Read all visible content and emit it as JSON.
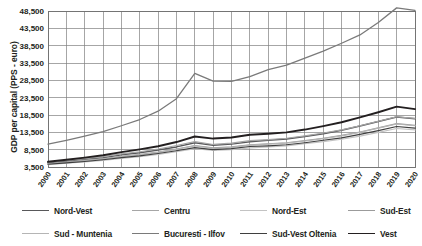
{
  "chart_data": {
    "type": "line",
    "title": "",
    "xlabel": "",
    "ylabel": "GDP per capital (PPS - euro)",
    "grid": true,
    "legend_position": "bottom",
    "ylim": [
      3500,
      48500
    ],
    "yticks": [
      "3,500",
      "8,500",
      "13,500",
      "18,500",
      "23,500",
      "28,500",
      "33,500",
      "38,500",
      "43,500",
      "48,500"
    ],
    "ytick_values": [
      3500,
      8500,
      13500,
      18500,
      23500,
      28500,
      33500,
      38500,
      43500,
      48500
    ],
    "categories": [
      "2000",
      "2001",
      "2002",
      "2003",
      "2004",
      "2005",
      "2006",
      "2007",
      "2008",
      "2009",
      "2010",
      "2011",
      "2012",
      "2013",
      "2014",
      "2015",
      "2016",
      "2017",
      "2018",
      "2019",
      "2020"
    ],
    "series": [
      {
        "name": "Nord-Vest",
        "color": "#58585a",
        "width": 1.5,
        "values": [
          4700,
          5200,
          5700,
          6200,
          7000,
          7600,
          8400,
          9300,
          10500,
          9800,
          10100,
          10800,
          11200,
          11600,
          12300,
          13100,
          14100,
          15300,
          16600,
          17900,
          17400
        ]
      },
      {
        "name": "Centru",
        "color": "#a6a6a6",
        "width": 1.2,
        "values": [
          4900,
          5400,
          5900,
          6500,
          7300,
          7900,
          8700,
          9700,
          10800,
          10000,
          10400,
          11100,
          11400,
          11800,
          12500,
          13300,
          14200,
          15400,
          16700,
          18000,
          17500
        ]
      },
      {
        "name": "Nord-Est",
        "color": "#c3c3c3",
        "width": 1.2,
        "values": [
          4200,
          4600,
          5000,
          5400,
          6000,
          6500,
          7100,
          7900,
          8800,
          8300,
          8500,
          9000,
          9300,
          9600,
          10200,
          10800,
          11500,
          12400,
          13500,
          14600,
          14200
        ]
      },
      {
        "name": "Sud-Est",
        "color": "#9b9b9b",
        "width": 1.2,
        "values": [
          4500,
          4900,
          5400,
          5900,
          6600,
          7100,
          7800,
          8700,
          9700,
          9000,
          9300,
          9900,
          10200,
          10500,
          11100,
          11800,
          12600,
          13600,
          14800,
          16000,
          15500
        ]
      },
      {
        "name": "Sud - Muntenia",
        "color": "#b5b5b5",
        "width": 1.2,
        "values": [
          4400,
          4800,
          5300,
          5800,
          6500,
          7000,
          7700,
          8600,
          9600,
          8900,
          9200,
          9800,
          10100,
          10400,
          11000,
          11700,
          12500,
          13500,
          14700,
          15900,
          15400
        ]
      },
      {
        "name": "Bucuresti - Ilfov",
        "color": "#7a7a7a",
        "width": 1.3,
        "values": [
          10100,
          11200,
          12400,
          13700,
          15400,
          17200,
          19600,
          23200,
          30500,
          28300,
          28200,
          29600,
          31600,
          32900,
          34900,
          36900,
          39200,
          41600,
          45200,
          49400,
          48700
        ]
      },
      {
        "name": "Sud-Vest Oltenia",
        "color": "#3f3f3f",
        "width": 1.1,
        "values": [
          4300,
          4700,
          5100,
          5600,
          6200,
          6700,
          7400,
          8200,
          9100,
          8500,
          8800,
          9400,
          9600,
          9900,
          10500,
          11200,
          11900,
          12900,
          14000,
          15200,
          14700
        ]
      },
      {
        "name": "Vest",
        "color": "#231f20",
        "width": 1.9,
        "values": [
          5000,
          5600,
          6200,
          6900,
          7800,
          8600,
          9500,
          10700,
          12300,
          11700,
          12000,
          12800,
          13100,
          13500,
          14300,
          15300,
          16400,
          17800,
          19300,
          20900,
          20200
        ]
      }
    ]
  },
  "legend": {
    "items": [
      {
        "label": "Nord-Vest"
      },
      {
        "label": "Centru"
      },
      {
        "label": "Nord-Est"
      },
      {
        "label": "Sud-Est"
      },
      {
        "label": "Sud - Muntenia"
      },
      {
        "label": "Bucuresti - Ilfov"
      },
      {
        "label": "Sud-Vest Oltenia"
      },
      {
        "label": "Vest"
      }
    ]
  }
}
